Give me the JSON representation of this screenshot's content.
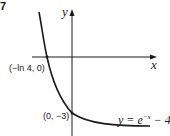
{
  "question_number": "7",
  "axes": {
    "x_label": "x",
    "y_label": "y"
  },
  "points": {
    "x_intercept": "(−ln 4, 0)",
    "y_intercept": "(0, −3)"
  },
  "curve": {
    "equation_prefix": "y = e",
    "equation_exponent": "−x",
    "equation_suffix": " − 4"
  },
  "colors": {
    "stroke": "#1a1a1a",
    "background": "#ffffff"
  }
}
